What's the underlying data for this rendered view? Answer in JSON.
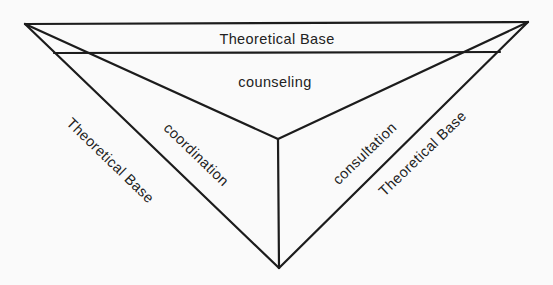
{
  "diagram": {
    "type": "inverted-pyramid",
    "colors": {
      "line": "#1c1c1c",
      "text": "#222222",
      "background": "#fafafa"
    },
    "labels": {
      "top_band": "Theoretical Base",
      "top_face": "counseling",
      "left_face": "coordination",
      "right_face": "consultation",
      "left_band": "Theoretical Base",
      "right_band": "Theoretical Base"
    }
  }
}
